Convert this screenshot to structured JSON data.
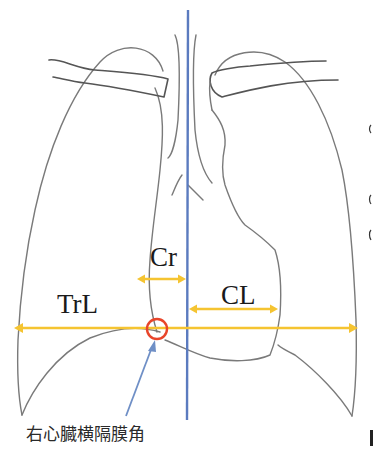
{
  "diagram": {
    "type": "chest-radiograph-schematic",
    "labels": {
      "cr": "Cr",
      "cl": "CL",
      "trl": "TrL",
      "angle": "右心臓横隔膜角"
    },
    "colors": {
      "midline": "#5b7bbf",
      "measure_arrow": "#f5c431",
      "marker_circle": "#e8452a",
      "pointer_arrow": "#6f8fc6",
      "outline": "#7a7a7a"
    },
    "measurements": [
      {
        "id": "Cr",
        "meaning": "right heart border to midline"
      },
      {
        "id": "CL",
        "meaning": "midline to left heart border"
      },
      {
        "id": "TrL",
        "meaning": "transverse thoracic diameter"
      }
    ]
  }
}
